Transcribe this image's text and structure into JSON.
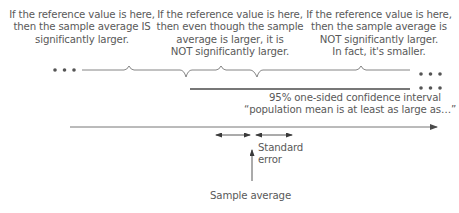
{
  "captions": {
    "left": [
      "If the reference value is here,",
      "then the sample average IS",
      "significantly larger."
    ],
    "middle": [
      "If the reference value is here,",
      "then even though the sample",
      "average is larger, it is",
      "NOT significantly larger."
    ],
    "right": [
      "If the reference value is here,",
      "then the sample average is",
      "NOT significantly larger.",
      "In fact, it's smaller."
    ]
  },
  "interval": {
    "line1": "95% one-sided confidence interval",
    "line2": "“population mean is at least as large as…”"
  },
  "standard_error": [
    "Standard",
    "error"
  ],
  "sample_average": "Sample average",
  "colors": {
    "line": "#6e6e6e",
    "thick_line": "#4a4a4a",
    "text": "#595959"
  }
}
